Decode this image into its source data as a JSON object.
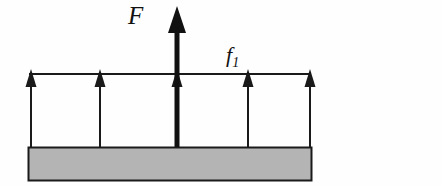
{
  "figure": {
    "kind": "free-body-force-diagram",
    "background_color": "#fefefe",
    "width": 442,
    "height": 187,
    "labels": {
      "applied_force": "F",
      "distributed_load_base": "f",
      "distributed_load_subscript": "1"
    },
    "beam": {
      "fill_color": "#b4b4b4",
      "stroke_color": "#1a1a1a",
      "x": 28,
      "y": 147,
      "width": 284,
      "height": 34
    },
    "load_line": {
      "stroke_color": "#1a1a1a",
      "x1": 29,
      "x2": 311,
      "y": 74
    },
    "distributed_arrows": {
      "count": 5,
      "x_positions": [
        31,
        100,
        177,
        248,
        310
      ],
      "tail_y": 147,
      "tip_y": 70,
      "stroke_color": "#1a1a1a",
      "shaft_width": 2,
      "head_width": 11,
      "head_height": 17
    },
    "applied_arrow": {
      "x": 177,
      "tail_y": 147,
      "tip_y": 7,
      "stroke_color": "#111111",
      "shaft_width": 5,
      "head_width": 18,
      "head_height": 24
    }
  }
}
